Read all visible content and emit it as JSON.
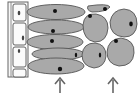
{
  "diagram": {
    "type": "plant-tissue-illustration",
    "colors": {
      "background": "#ffffff",
      "cell_fill": "#a9a9a9",
      "cell_outline": "#555555",
      "nucleus": "#111111",
      "epidermis_fill": "#f4f4f4",
      "arrow": "#666666"
    },
    "regions": [
      {
        "id": "epidermis",
        "shape": "rectangular",
        "count": 3
      },
      {
        "id": "palisade",
        "shape": "elongated",
        "count": 5
      },
      {
        "id": "spongy",
        "shape": "rounded",
        "count": 5
      }
    ],
    "arrows": [
      {
        "direction": "up",
        "target": "palisade"
      },
      {
        "direction": "up",
        "target": "spongy"
      }
    ]
  }
}
